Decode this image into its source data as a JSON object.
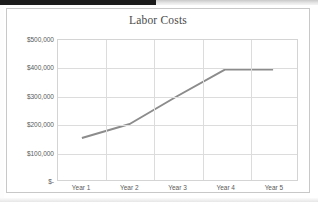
{
  "chart_data": {
    "type": "line",
    "title": "Labor Costs",
    "xlabel": "",
    "ylabel": "",
    "categories": [
      "Year 1",
      "Year 2",
      "Year 3",
      "Year 4",
      "Year 5"
    ],
    "series": [
      {
        "name": "Labor Costs",
        "values": [
          150000,
          200000,
          300000,
          395000,
          395000
        ],
        "color": "#8c8c8c"
      }
    ],
    "ylim": [
      0,
      500000
    ],
    "ytick_values": [
      500000,
      400000,
      300000,
      200000,
      100000,
      0
    ],
    "ytick_labels": [
      "$500,000",
      "$400,000",
      "$300,000",
      "$200,000",
      "$100,000",
      "$-"
    ],
    "grid": true,
    "legend": false,
    "legend_position": "none",
    "plot_background": "#ffffff",
    "gridline_color": "#dcdcdc",
    "border_color": "#c8c8c8"
  }
}
